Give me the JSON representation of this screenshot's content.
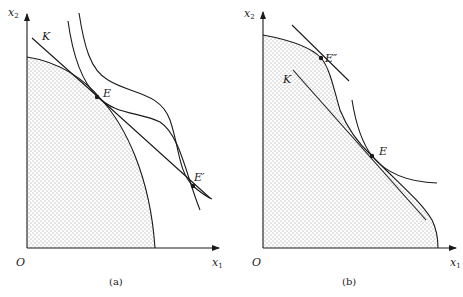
{
  "panels": [
    {
      "id": "a",
      "caption": "(a)",
      "origin_label": "O",
      "x_axis": {
        "var": "x",
        "sub": "1"
      },
      "y_axis": {
        "var": "x",
        "sub": "2"
      },
      "points": [
        {
          "label": "E",
          "role": "tangency of production frontier, line K and indifference curve"
        },
        {
          "label": "E′",
          "role": "second tangency of line K with a higher indifference curve"
        }
      ],
      "line_label": "K",
      "region": "shaded production possibility set"
    },
    {
      "id": "b",
      "caption": "(b)",
      "origin_label": "O",
      "x_axis": {
        "var": "x",
        "sub": "1"
      },
      "y_axis": {
        "var": "x",
        "sub": "2"
      },
      "points": [
        {
          "label": "E″",
          "role": "tangency point on upper part of frontier"
        },
        {
          "label": "E",
          "role": "tangency of frontier, line K and indifference curve"
        }
      ],
      "line_label": "K",
      "region": "shaded non-convex production possibility set"
    }
  ],
  "colors": {
    "ink": "#1a1a1a",
    "shade_dot": "#8a8a8a",
    "background": "#ffffff"
  }
}
